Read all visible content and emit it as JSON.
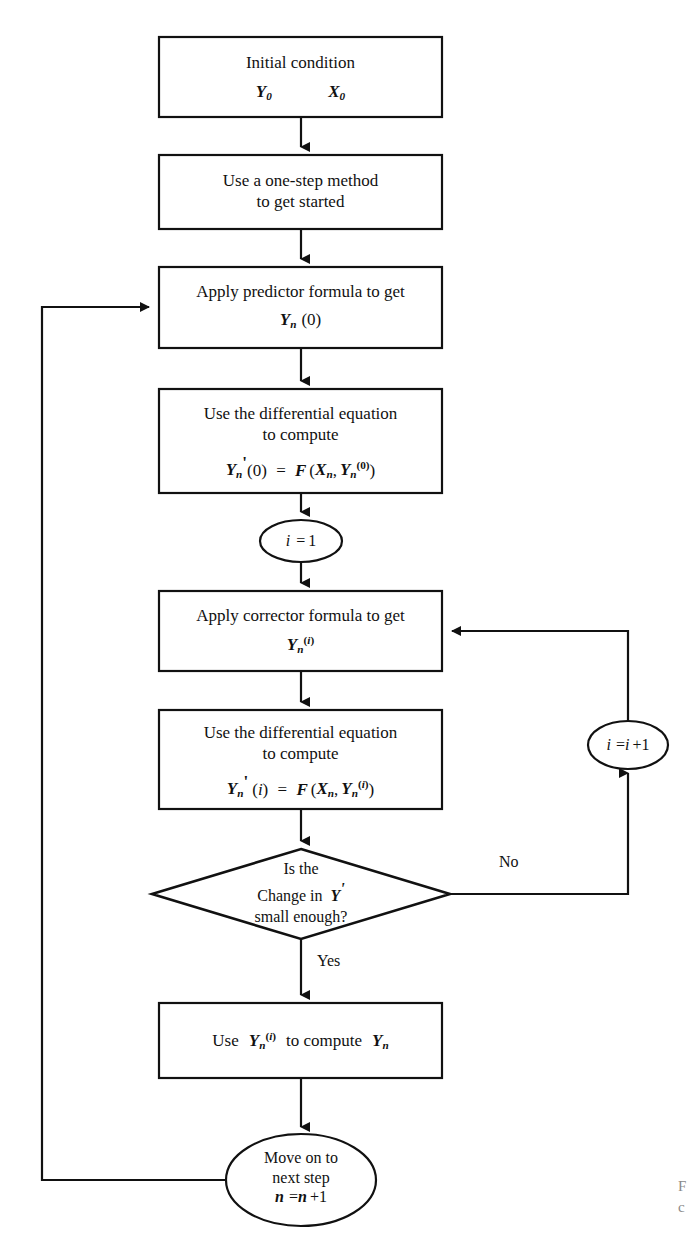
{
  "diagram": {
    "type": "flowchart",
    "colors": {
      "stroke": "#111111",
      "background": "#ffffff",
      "text": "#111111"
    },
    "nodes": [
      {
        "id": "initial-condition",
        "shape": "rectangle",
        "lines": [
          "Initial condition",
          "Y0      X0"
        ],
        "line1": "Initial condition",
        "sym_y": "Y",
        "sym_y_sub": "0",
        "sym_x": "X",
        "sym_x_sub": "0"
      },
      {
        "id": "one-step-method",
        "shape": "rectangle",
        "line1": "Use a one-step method",
        "line2": "to get started"
      },
      {
        "id": "apply-predictor",
        "shape": "rectangle",
        "line1": "Apply predictor formula to get",
        "formula": "Yn (0)",
        "sym_y": "Y",
        "sym_sub": "n",
        "sym_arg": "(0)"
      },
      {
        "id": "differential-equation-predictor",
        "shape": "rectangle",
        "line1": "Use the differential equation",
        "line2": "to compute",
        "formula": "Y'n(0) = F (Xn , Yn(0))"
      },
      {
        "id": "i-equals-1",
        "shape": "ellipse",
        "label": "i  = 1"
      },
      {
        "id": "apply-corrector",
        "shape": "rectangle",
        "line1": "Apply corrector formula to get",
        "formula": "Yn(i)"
      },
      {
        "id": "differential-equation-corrector",
        "shape": "rectangle",
        "line1": "Use the differential equation",
        "line2": "to compute",
        "formula": "Y'n (i) = F (Xn , Yn(i))"
      },
      {
        "id": "convergence-decision",
        "shape": "diamond",
        "line1": "Is the",
        "line2": "Change in  Y'",
        "line3": "small enough?"
      },
      {
        "id": "increment-i",
        "shape": "ellipse",
        "label": "i  = i +1"
      },
      {
        "id": "compute-yn",
        "shape": "rectangle",
        "formula": "Use  Yn(i)  to compute  Yn"
      },
      {
        "id": "move-next-step",
        "shape": "ellipse",
        "line1": "Move on to",
        "line2": "next step",
        "line3": "n  = n +1"
      }
    ],
    "edge_labels": {
      "no": "No",
      "yes": "Yes"
    },
    "text": {
      "initial_condition": "Initial condition",
      "one_step_l1": "Use a one-step method",
      "one_step_l2": "to get started",
      "predictor_l1": "Apply predictor formula to get",
      "diffeq_l1": "Use the differential equation",
      "diffeq_l2": "to compute",
      "corrector_l1": "Apply corrector formula to get",
      "decision_l1": "Is the",
      "decision_l2a": "Change in",
      "decision_l3": "small enough?",
      "move_l1": "Move on to",
      "move_l2": "next step",
      "use_word": "Use",
      "to_compute_word": "to compute",
      "letter_y": "Y",
      "letter_x": "X",
      "letter_f": "F",
      "letter_n": "n",
      "letter_i": "i",
      "zero": "0",
      "one": "1",
      "eq": "=",
      "plus_one": "+1",
      "prime": "'",
      "open_paren": "(",
      "close_paren": ")",
      "comma": ","
    },
    "caption_cut": {
      "line1": "F",
      "line2": "c"
    }
  }
}
